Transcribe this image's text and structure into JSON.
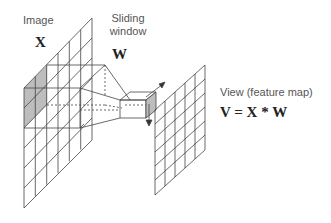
{
  "labels": {
    "image": "Image",
    "image_symbol": "X",
    "window_line1": "Sliding",
    "window_line2": "window",
    "window_symbol": "W",
    "view": "View (feature map)",
    "equation": "V = X * W"
  },
  "colors": {
    "line": "#333333",
    "grid": "#555555",
    "shade": "#bdbdbd"
  }
}
